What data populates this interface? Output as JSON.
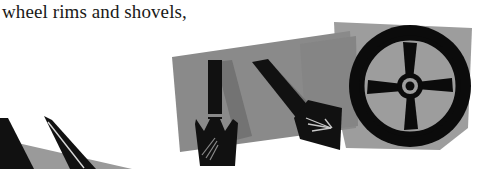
{
  "page": {
    "width": 485,
    "height": 169,
    "background_color": "#ffffff",
    "kind": "scanned-illustration-fragment"
  },
  "caption": {
    "text": "wheel rims and shovels,",
    "color": "#1a1a18",
    "style": "serif"
  },
  "palette": {
    "ink_black": "#0b0b0b",
    "silhouette_black": "#111111",
    "band_gray": "#8a8a8a",
    "band_gray_light": "#9d9d9d",
    "band_gray_dark": "#767676",
    "shadow_gray": "#6f6f6f",
    "paper_white": "#ffffff"
  },
  "illustrations": [
    {
      "name": "wheel-rim",
      "label": "wheel rim",
      "center_x": 410,
      "center_y": 86,
      "outer_radius": 62,
      "tire_thickness": 13,
      "spoke_count": 4,
      "hub_radius": 13,
      "color": "#0b0b0b"
    },
    {
      "name": "shovel-upright",
      "label": "shovel",
      "x": 205,
      "y": 60,
      "orientation_deg": 0,
      "color": "#111111"
    },
    {
      "name": "shovel-diagonal",
      "label": "shovel",
      "x": 262,
      "y": 66,
      "orientation_deg": 45,
      "color": "#111111"
    },
    {
      "name": "shovel-cropped-left",
      "label": "shovel (cropped)",
      "x": 0,
      "y": 118,
      "orientation_deg": 60,
      "color": "#111111"
    }
  ],
  "background_shapes": [
    {
      "name": "gray-band-main",
      "type": "skewed-quadrilateral",
      "fill": "#8a8a8a",
      "points": "172,58 345,32 352,132 178,152"
    },
    {
      "name": "gray-patch-wheel",
      "type": "quadrilateral",
      "fill": "#9d9d9d",
      "points": "334,22 470,30 466,150 342,146"
    },
    {
      "name": "gray-wedge-bottom-left",
      "type": "triangle",
      "fill": "#9a9a9a",
      "points": "0,140 130,169 0,169"
    }
  ]
}
